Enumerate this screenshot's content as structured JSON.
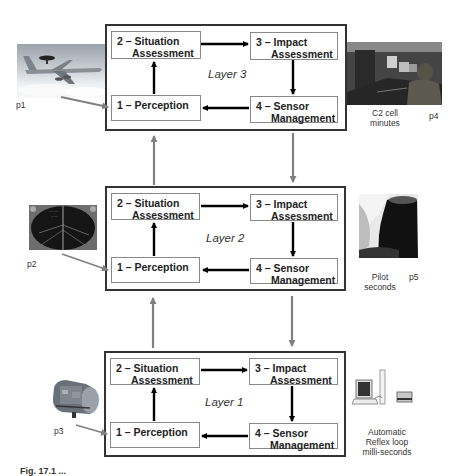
{
  "layers": [
    {
      "label": "Layer 3",
      "nodes": {
        "situation": {
          "line1": "2 – Situation",
          "line2": "Assessment"
        },
        "impact": {
          "line1": "3 – Impact",
          "line2": "Assessment"
        },
        "perception": {
          "line1": "1 – Perception",
          "line2": ""
        },
        "sensor": {
          "line1": "4 – Sensor",
          "line2": "Management"
        }
      }
    },
    {
      "label": "Layer 2",
      "nodes": {
        "situation": {
          "line1": "2 – Situation",
          "line2": "Assessment"
        },
        "impact": {
          "line1": "3 – Impact",
          "line2": "Assessment"
        },
        "perception": {
          "line1": "1 – Perception",
          "line2": ""
        },
        "sensor": {
          "line1": "4 – Sensor",
          "line2": "Management"
        }
      }
    },
    {
      "label": "Layer 1",
      "nodes": {
        "situation": {
          "line1": "2 – Situation",
          "line2": "Assessment"
        },
        "impact": {
          "line1": "3 – Impact",
          "line2": "Assessment"
        },
        "perception": {
          "line1": "1 – Perception",
          "line2": ""
        },
        "sensor": {
          "line1": "4 – Sensor",
          "line2": "Management"
        }
      }
    }
  ],
  "images": {
    "p1": {
      "label": "p1",
      "subject": "AWACS aircraft"
    },
    "p2": {
      "label": "p2",
      "subject": "radar display"
    },
    "p3": {
      "label": "p3",
      "subject": "sensor device"
    },
    "p4": {
      "label": "p4",
      "subject": "C2 cell operators",
      "caption_line1": "C2 cell",
      "caption_line2": "minutes"
    },
    "p5": {
      "label": "p5",
      "subject": "pilot",
      "caption_line1": "Pilot",
      "caption_line2": "seconds"
    },
    "p6": {
      "subject": "computer workstation",
      "caption_line1": "Automatic",
      "caption_line2": "Reflex loop",
      "caption_line3": "milli-seconds"
    }
  },
  "figure_caption": "Fig. 17.1  ...",
  "colors": {
    "box_border": "#333333",
    "node_border": "#888888",
    "black_arrow": "#000000",
    "gray_arrow": "#808080"
  }
}
